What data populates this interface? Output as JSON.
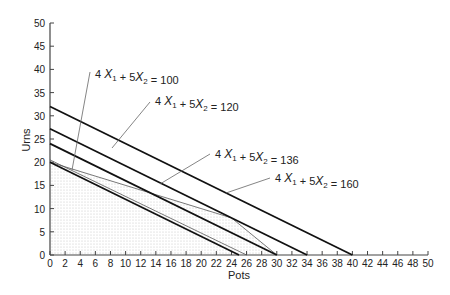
{
  "chart_data": {
    "type": "line",
    "title": "",
    "xlabel": "Pots",
    "ylabel": "Urns",
    "xlim": [
      0,
      50
    ],
    "ylim": [
      0,
      50
    ],
    "x_ticks": [
      0,
      2,
      4,
      6,
      8,
      10,
      12,
      14,
      16,
      18,
      20,
      22,
      24,
      26,
      28,
      30,
      32,
      34,
      36,
      38,
      40,
      42,
      44,
      46,
      48,
      50
    ],
    "y_ticks": [
      0,
      5,
      10,
      15,
      20,
      25,
      30,
      35,
      40,
      45,
      50
    ],
    "grid": false,
    "series": [
      {
        "name": "4 X1 + 5 X2 = 100",
        "points": [
          [
            0,
            20
          ],
          [
            25,
            0
          ]
        ],
        "label_value": "100"
      },
      {
        "name": "4 X1 + 5 X2 = 120",
        "points": [
          [
            0,
            24
          ],
          [
            30,
            0
          ]
        ],
        "label_value": "120"
      },
      {
        "name": "4 X1 + 5 X2 = 136",
        "points": [
          [
            0,
            27.2
          ],
          [
            34,
            0
          ]
        ],
        "label_value": "136"
      },
      {
        "name": "4 X1 + 5 X2 = 160",
        "points": [
          [
            0,
            32
          ],
          [
            40,
            0
          ]
        ],
        "label_value": "160"
      }
    ],
    "constraints": [
      {
        "points": [
          [
            0,
            20.5
          ],
          [
            26,
            0
          ]
        ]
      },
      {
        "points": [
          [
            0,
            20
          ],
          [
            24,
            8
          ],
          [
            30,
            0
          ]
        ]
      }
    ],
    "feasible_region": [
      [
        0,
        0
      ],
      [
        0,
        20
      ],
      [
        3,
        18.5
      ],
      [
        24,
        8
      ],
      [
        30,
        0
      ]
    ],
    "annotations": [
      {
        "text": "4 X1 + 5 X2 = 100",
        "sub": [
          "1",
          "2"
        ],
        "value": "100"
      },
      {
        "text": "4 X1 + 5 X2 = 120",
        "value": "120"
      },
      {
        "text": "4 X1 + 5 X2 = 136",
        "value": "136"
      },
      {
        "text": "4 X1 + 5 X2 = 160",
        "value": "160"
      }
    ]
  },
  "labels": {
    "xlabel": "Pots",
    "ylabel": "Urns",
    "eq_prefix": "4",
    "eq_x": "X",
    "eq_plus": "+ 5",
    "eq_sub1": "1",
    "eq_sub2": "2",
    "eq_eq": "=",
    "v100": "100",
    "v120": "120",
    "v136": "136",
    "v160": "160"
  }
}
